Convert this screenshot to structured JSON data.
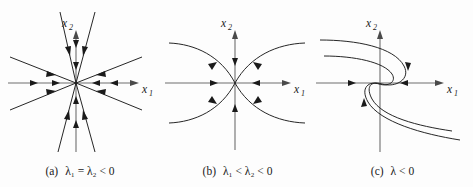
{
  "figure": {
    "background_color": "#fdfdfd",
    "axis_color": "#6e6e6e",
    "trajectory_color": "#1a1a1a",
    "text_color": "#1a1a1a"
  },
  "panels": [
    {
      "id": "a",
      "tag": "(a)",
      "expression": "λ₁ = λ₂ < 0",
      "axis_x_label": "x",
      "axis_x_sub": "1",
      "axis_y_label": "x",
      "axis_y_sub": "2",
      "phase_portrait_type": "star-node-stable",
      "description": "Proper node (star node): eight straight rays through the origin with arrowheads pointing inward toward the origin."
    },
    {
      "id": "b",
      "tag": "(b)",
      "expression": "λ₁ < λ₂ < 0",
      "axis_x_label": "x",
      "axis_x_sub": "1",
      "axis_y_label": "x",
      "axis_y_sub": "2",
      "phase_portrait_type": "node-stable",
      "description": "Stable node: four curved trajectories tangent to the vertical axis near the origin, plus straight trajectories along both axes, all directed inward."
    },
    {
      "id": "c",
      "tag": "(c)",
      "expression": "λ < 0",
      "axis_x_label": "x",
      "axis_x_sub": "1",
      "axis_y_label": "x",
      "axis_y_sub": "2",
      "phase_portrait_type": "degenerate-node-stable",
      "description": "Degenerate (improper) node: two S-shaped spiral-like trajectories with 180-degree rotational symmetry curling into the origin."
    }
  ]
}
